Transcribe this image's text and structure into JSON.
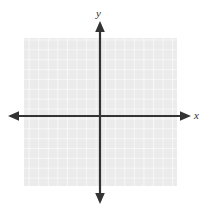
{
  "figure": {
    "width": 205,
    "height": 209,
    "background_color": "#ffffff"
  },
  "chart_data": {
    "type": "scatter",
    "title": "",
    "subtitle": "",
    "xlabel": "x",
    "ylabel": "y",
    "series": [
      {
        "name": "",
        "x": [],
        "y": []
      }
    ],
    "x": [],
    "values": [],
    "categories": [],
    "xlim": [
      -8,
      8
    ],
    "ylim": [
      -7,
      8
    ],
    "grid": true,
    "grid_spacing": 1,
    "grid_columns": 16,
    "grid_rows": 15,
    "legend": false,
    "legend_position": "none",
    "tick_labels_x": [],
    "tick_labels_y": [],
    "annotations": []
  },
  "axes": {
    "x_label": "x",
    "y_label": "y",
    "origin_x_px": 100,
    "origin_y_px": 116,
    "line_color": "#333333",
    "line_width_px": 2,
    "arrow_style": "solid-triangle",
    "x_start_px": 8,
    "x_end_px": 191,
    "y_start_px": 21,
    "y_end_px": 204
  },
  "grid": {
    "fill_color": "#ebebeb",
    "line_color": "#fafafa",
    "left_px": 24,
    "top_px": 38,
    "width_px": 153,
    "height_px": 148,
    "cell_size_px": 9.6
  }
}
